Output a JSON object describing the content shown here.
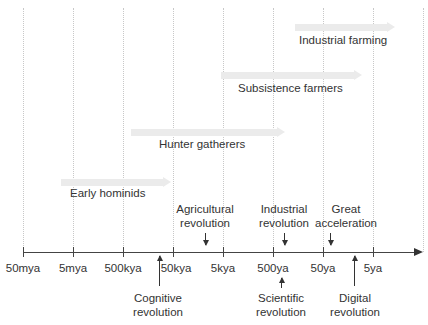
{
  "diagram": {
    "title": "",
    "axis": {
      "ticks": [
        "50mya",
        "5mya",
        "500kya",
        "50kya",
        "5kya",
        "500ya",
        "50ya",
        "5ya"
      ]
    },
    "bands": [
      {
        "label": "Early hominids",
        "start_tick": 0.8,
        "end_tick": 2.0
      },
      {
        "label": "Hunter gatherers",
        "start_tick": 2.2,
        "end_tick": 5.2
      },
      {
        "label": "Subsistence farmers",
        "start_tick": 4.0,
        "end_tick": 6.8
      },
      {
        "label": "Industrial farming",
        "start_tick": 5.5,
        "end_tick": 7.4
      }
    ],
    "events_above": [
      {
        "label_line1": "Agricultural",
        "label_line2": "revolution"
      },
      {
        "label_line1": "Industrial",
        "label_line2": "revolution"
      },
      {
        "label_line1": "Great",
        "label_line2": "acceleration"
      }
    ],
    "events_below": [
      {
        "label_line1": "Cognitive",
        "label_line2": "revolution"
      },
      {
        "label_line1": "Scientific",
        "label_line2": "revolution"
      },
      {
        "label_line1": "Digital",
        "label_line2": "revolution"
      }
    ]
  }
}
